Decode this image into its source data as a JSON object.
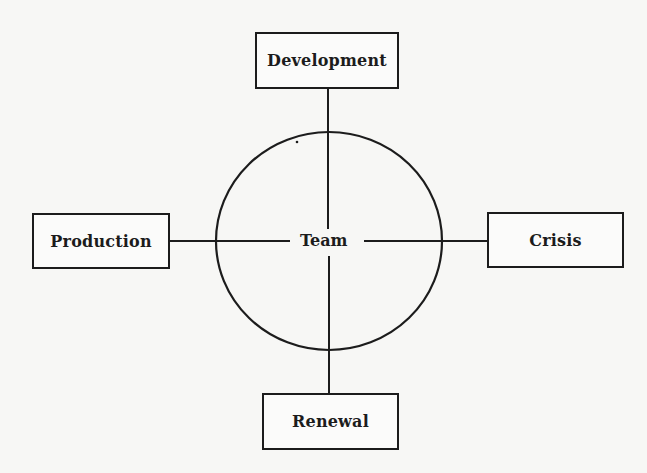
{
  "diagram": {
    "center": {
      "label": "Team",
      "shape": "circle"
    },
    "nodes": [
      {
        "id": "top",
        "label": "Development",
        "position": "top"
      },
      {
        "id": "left",
        "label": "Production",
        "position": "left"
      },
      {
        "id": "right",
        "label": "Crisis",
        "position": "right"
      },
      {
        "id": "bottom",
        "label": "Renewal",
        "position": "bottom"
      }
    ],
    "edges": [
      {
        "from": "Team",
        "to": "Development"
      },
      {
        "from": "Team",
        "to": "Production"
      },
      {
        "from": "Team",
        "to": "Crisis"
      },
      {
        "from": "Team",
        "to": "Renewal"
      }
    ],
    "colors": {
      "line": "#1c1c1c",
      "background": "#f7f7f5"
    }
  }
}
